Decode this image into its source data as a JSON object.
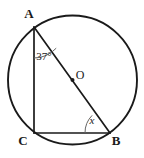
{
  "figure": {
    "kind": "circle-geometry-diagram",
    "background_color": "#ffffff",
    "stroke_color": "#1a1a1a",
    "arc_color": "#555555",
    "circle": {
      "center_label": "O",
      "center_x": 72.5,
      "center_y": 80,
      "radius": 64.5,
      "stroke_width": 1.9
    },
    "points": [
      {
        "name": "A",
        "label": "A",
        "x": 34,
        "y": 27,
        "label_x": 29,
        "label_y": 15
      },
      {
        "name": "B",
        "label": "B",
        "x": 110,
        "y": 133,
        "label_x": 116,
        "label_y": 142
      },
      {
        "name": "C",
        "label": "C",
        "x": 34,
        "y": 133,
        "label_x": 23,
        "label_y": 142
      },
      {
        "name": "O",
        "label": "O",
        "x": 72.5,
        "y": 80,
        "label_x": 80,
        "label_y": 76
      }
    ],
    "segments": [
      {
        "name": "segment-AC",
        "from": "A",
        "to": "C",
        "x1": 34,
        "y1": 27,
        "x2": 34,
        "y2": 133
      },
      {
        "name": "segment-CB",
        "from": "C",
        "to": "B",
        "x1": 34,
        "y1": 133,
        "x2": 110,
        "y2": 133
      },
      {
        "name": "segment-AB-diameter",
        "from": "A",
        "to": "B",
        "x1": 34,
        "y1": 27,
        "x2": 110,
        "y2": 133
      }
    ],
    "angles": [
      {
        "name": "angle-at-A",
        "vertex": "A",
        "label": "37°",
        "value": 37,
        "unit": "degrees",
        "label_x": 44,
        "label_y": 57,
        "arc_radius": 31
      },
      {
        "name": "angle-at-B",
        "vertex": "B",
        "label": "x",
        "value": null,
        "unit": "unknown",
        "label_x": 92,
        "label_y": 121,
        "arc_radius": 25
      }
    ],
    "center_dot_radius": 2.0
  }
}
